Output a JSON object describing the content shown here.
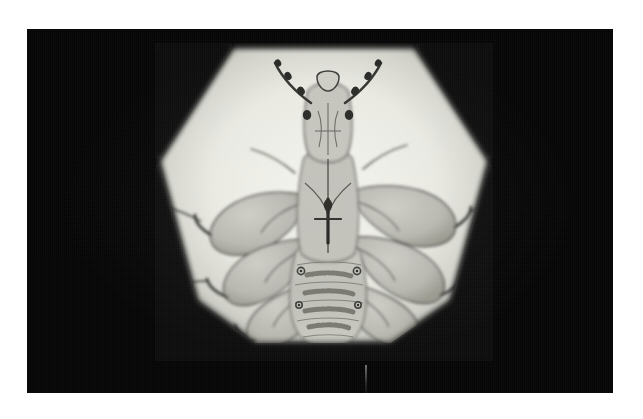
{
  "page": {
    "kind": "photomicrograph-print",
    "background_color": "#ffffff",
    "print_border_color": "#050505",
    "caption": ""
  },
  "photo": {
    "title": "Light photomicrograph of a louse, ventral view",
    "modality": "brightfield-light-microscopy",
    "color_mode": "grayscale",
    "background_color": "#050505",
    "field_shape": "hexagonal",
    "field_bright_color": "#efefe9",
    "field_mid_color": "#d8d8d2",
    "specimen_color": "#b9b9b2",
    "specimen_dark_color": "#3a3a38",
    "artifact": "vertical dust streak below specimen"
  },
  "specimen": {
    "common_name": "louse",
    "orientation": "ventral",
    "anatomy": [
      {
        "part": "head",
        "count": 1
      },
      {
        "part": "antenna",
        "count": 2
      },
      {
        "part": "mouthparts",
        "count": 1
      },
      {
        "part": "thorax",
        "count": 1
      },
      {
        "part": "leg",
        "count": 6
      },
      {
        "part": "tarsal-claw",
        "count": 6
      },
      {
        "part": "abdomen",
        "count": 1
      },
      {
        "part": "abdominal-band",
        "count": 5
      },
      {
        "part": "spiracle",
        "count": 4
      },
      {
        "part": "seta",
        "count": 12
      }
    ]
  }
}
